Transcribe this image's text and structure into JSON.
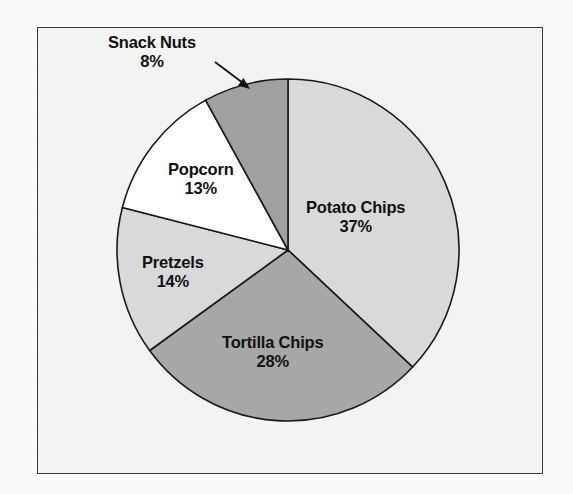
{
  "figure": {
    "background_color": "#fbfbfa",
    "frame_color": "#3a3a3a",
    "plot_background_color": "#f3f3f2"
  },
  "chart_data": {
    "type": "pie",
    "title": "",
    "subtitle": "",
    "xlabel": "",
    "ylabel": "",
    "grid": false,
    "legend": "none",
    "start_angle_deg": 0,
    "direction": "clockwise",
    "units": "percent",
    "categories": [
      "Potato Chips",
      "Tortilla Chips",
      "Pretzels",
      "Popcorn",
      "Snack Nuts"
    ],
    "values": [
      37,
      28,
      14,
      13,
      8
    ],
    "value_labels": [
      "37%",
      "28%",
      "14%",
      "13%",
      "8%"
    ],
    "slice_colors": [
      "#d9d9d9",
      "#a7a7a7",
      "#d9d9d9",
      "#ffffff",
      "#a0a0a0"
    ],
    "slice_edge_color": "#1a1a1a",
    "annotations": [
      {
        "text": "Snack Nuts 8%",
        "placement": "outside",
        "leader_line": true,
        "arrow": true
      }
    ],
    "slices": [
      {
        "name": "Potato Chips",
        "value": 37,
        "value_label": "37%",
        "color": "#d9d9d9",
        "label_placement": "inside",
        "start_angle_deg": 0.0,
        "end_angle_deg": 133.2
      },
      {
        "name": "Tortilla Chips",
        "value": 28,
        "value_label": "28%",
        "color": "#a7a7a7",
        "label_placement": "inside",
        "start_angle_deg": 133.2,
        "end_angle_deg": 234.0
      },
      {
        "name": "Pretzels",
        "value": 14,
        "value_label": "14%",
        "color": "#d9d9d9",
        "label_placement": "inside",
        "start_angle_deg": 234.0,
        "end_angle_deg": 284.4
      },
      {
        "name": "Popcorn",
        "value": 13,
        "value_label": "13%",
        "color": "#ffffff",
        "label_placement": "inside",
        "start_angle_deg": 284.4,
        "end_angle_deg": 331.2
      },
      {
        "name": "Snack Nuts",
        "value": 8,
        "value_label": "8%",
        "color": "#a0a0a0",
        "label_placement": "outside",
        "start_angle_deg": 331.2,
        "end_angle_deg": 360.0
      }
    ]
  },
  "labels": {
    "potato_chips": {
      "name": "Potato Chips",
      "value": "37%"
    },
    "tortilla_chips": {
      "name": "Tortilla Chips",
      "value": "28%"
    },
    "pretzels": {
      "name": "Pretzels",
      "value": "14%"
    },
    "popcorn": {
      "name": "Popcorn",
      "value": "13%"
    },
    "snack_nuts": {
      "name": "Snack Nuts",
      "value": "8%"
    }
  }
}
